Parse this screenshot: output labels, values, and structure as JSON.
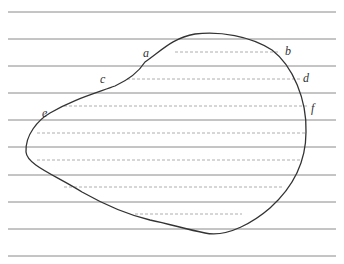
{
  "diagram": {
    "type": "closed-curve-with-horizontal-lines",
    "colors": {
      "solid_line": "#8a8a8a",
      "dashed_line": "#9a9a9a",
      "curve": "#333333",
      "label": "#333333"
    },
    "solid_lines_y": [
      12,
      39,
      66,
      93,
      120,
      147,
      175,
      202,
      229,
      256
    ],
    "solid_line_x": [
      8,
      336
    ],
    "dashed_lines": [
      {
        "y": 52,
        "x1": 175,
        "x2": 278
      },
      {
        "y": 79,
        "x1": 127,
        "x2": 302
      },
      {
        "y": 106,
        "x1": 64,
        "x2": 308
      },
      {
        "y": 133,
        "x1": 37,
        "x2": 307
      },
      {
        "y": 160,
        "x1": 37,
        "x2": 302
      },
      {
        "y": 187,
        "x1": 64,
        "x2": 283
      },
      {
        "y": 214,
        "x1": 135,
        "x2": 242
      }
    ],
    "labels": [
      {
        "id": "a",
        "text": "a",
        "x": 143,
        "y": 57
      },
      {
        "id": "b",
        "text": "b",
        "x": 285,
        "y": 55
      },
      {
        "id": "c",
        "text": "c",
        "x": 100,
        "y": 83
      },
      {
        "id": "d",
        "text": "d",
        "x": 303,
        "y": 82
      },
      {
        "id": "e",
        "text": "e",
        "x": 42,
        "y": 117
      },
      {
        "id": "f",
        "text": "f",
        "x": 311,
        "y": 112
      }
    ]
  }
}
